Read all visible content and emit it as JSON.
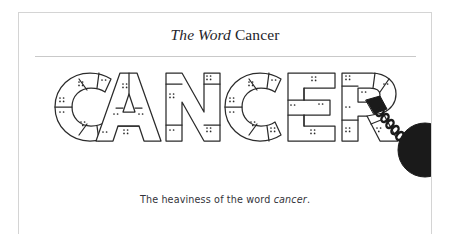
{
  "page": {
    "background_color": "#ffffff",
    "border_color": "#d4d4d4",
    "rule_color": "#c9c9c9"
  },
  "header": {
    "title_italic": "The Word",
    "title_roman": "Cancer",
    "title_full": "The Word Cancer",
    "title_color": "#24242a"
  },
  "figure": {
    "name": "cancer-wrecking-ball-illustration",
    "word": "CANCER",
    "letters": [
      "C",
      "A",
      "N",
      "C",
      "E",
      "R"
    ],
    "style": "outlined block letters with segment lines and stipple marks",
    "stroke_color": "#2b2b2b",
    "fill_color": "#ffffff",
    "ball": {
      "name": "wrecking-ball",
      "color": "#1a1a1a",
      "attached_to_letter": "R"
    },
    "chain": {
      "name": "chain",
      "color": "#1a1a1a",
      "link_count": 9
    },
    "shackle": {
      "name": "shackle",
      "color": "#1a1a1a"
    }
  },
  "caption": {
    "text_before": "The heaviness of the word ",
    "text_italic": "cancer",
    "text_after": ".",
    "text_full": "The heaviness of the word cancer.",
    "color": "#33333a"
  }
}
